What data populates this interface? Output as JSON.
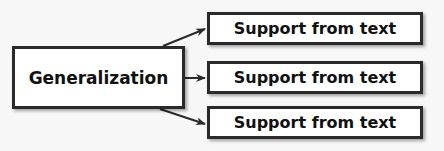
{
  "diagram": {
    "type": "concept-map",
    "main_node": {
      "label": "Generalization"
    },
    "support_nodes": [
      {
        "label": "Support from text"
      },
      {
        "label": "Support from text"
      },
      {
        "label": "Support from text"
      }
    ],
    "edges": [
      {
        "from": "Generalization",
        "to": "support_nodes.0"
      },
      {
        "from": "Generalization",
        "to": "support_nodes.1"
      },
      {
        "from": "Generalization",
        "to": "support_nodes.2"
      }
    ],
    "colors": {
      "border": "#2a2a2a",
      "fill": "#ffffff",
      "background": "#f7f7f7",
      "text": "#111111"
    }
  }
}
